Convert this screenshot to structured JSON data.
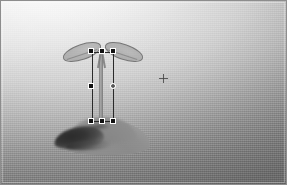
{
  "viewport": {
    "name": "3d-render-viewport",
    "width": 287,
    "height": 185,
    "background_top_color": "#f7f7f7",
    "background_bottom_color": "#7e7e7e",
    "frame_color": "#8d8d8d"
  },
  "scene": {
    "subject_label": "seedling",
    "ground_label": "ground-mound",
    "shadow_label": "cast-shadow",
    "leaf_left_label": "cotyledon-left",
    "leaf_right_label": "cotyledon-right",
    "stem_label": "stem"
  },
  "selection": {
    "label": "selection-bounding-box",
    "outline_color": "#2a2a2a",
    "handle_fill": "#101010",
    "handle_border": "#ffffff",
    "rotate_handle_fill": "#f4f4f4",
    "x": 92,
    "y": 52,
    "width": 22,
    "height": 70,
    "handles": [
      {
        "name": "handle-top-left",
        "x": 0,
        "y": 0,
        "shape": "square"
      },
      {
        "name": "handle-top-center",
        "x": 11,
        "y": 0,
        "shape": "square"
      },
      {
        "name": "handle-top-right",
        "x": 22,
        "y": 0,
        "shape": "square"
      },
      {
        "name": "handle-middle-left",
        "x": 0,
        "y": 35,
        "shape": "square"
      },
      {
        "name": "handle-middle-right",
        "x": 22,
        "y": 35,
        "shape": "round"
      },
      {
        "name": "handle-bottom-left",
        "x": 0,
        "y": 70,
        "shape": "square"
      },
      {
        "name": "handle-bottom-center",
        "x": 11,
        "y": 70,
        "shape": "square"
      },
      {
        "name": "handle-bottom-right",
        "x": 22,
        "y": 70,
        "shape": "square"
      }
    ]
  },
  "cursor": {
    "label": "crosshair-cursor",
    "x": 163,
    "y": 78,
    "color": "#464646"
  }
}
